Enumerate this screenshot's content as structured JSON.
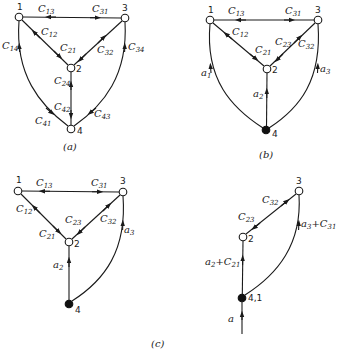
{
  "panels": {
    "a": {
      "caption": "(a)",
      "nodes": [
        {
          "id": "1",
          "label": "1",
          "x": 19,
          "y": 17,
          "filled": false
        },
        {
          "id": "2",
          "label": "2",
          "x": 71,
          "y": 68,
          "filled": false
        },
        {
          "id": "3",
          "label": "3",
          "x": 125,
          "y": 18,
          "filled": false
        },
        {
          "id": "4",
          "label": "4",
          "x": 71,
          "y": 129,
          "filled": false
        }
      ],
      "edge_labels": {
        "c13": {
          "base": "C",
          "sub": "13"
        },
        "c31": {
          "base": "C",
          "sub": "31"
        },
        "c12": {
          "base": "C",
          "sub": "12"
        },
        "c21": {
          "base": "C",
          "sub": "21"
        },
        "c32": {
          "base": "C",
          "sub": "32"
        },
        "c34": {
          "base": "C",
          "sub": "34"
        },
        "c14": {
          "base": "C",
          "sub": "14"
        },
        "c24": {
          "base": "C",
          "sub": "24"
        },
        "c42": {
          "base": "C",
          "sub": "42"
        },
        "c41": {
          "base": "C",
          "sub": "41"
        },
        "c43": {
          "base": "C",
          "sub": "43"
        }
      }
    },
    "b": {
      "caption": "(b)",
      "nodes": [
        {
          "id": "1",
          "label": "1",
          "x": 210,
          "y": 20,
          "filled": false
        },
        {
          "id": "2",
          "label": "2",
          "x": 267,
          "y": 69,
          "filled": false
        },
        {
          "id": "3",
          "label": "3",
          "x": 318,
          "y": 20,
          "filled": false
        },
        {
          "id": "4",
          "label": "4",
          "x": 266,
          "y": 130,
          "filled": true
        }
      ],
      "edge_labels": {
        "c13": {
          "base": "C",
          "sub": "13"
        },
        "c31": {
          "base": "C",
          "sub": "31"
        },
        "c12": {
          "base": "C",
          "sub": "12"
        },
        "c21": {
          "base": "C",
          "sub": "21"
        },
        "c23": {
          "base": "C",
          "sub": "23"
        },
        "c32": {
          "base": "C",
          "sub": "32"
        },
        "a1": {
          "base": "a",
          "sub": "1"
        },
        "a2": {
          "base": "a",
          "sub": "2"
        },
        "a3": {
          "base": "a",
          "sub": "3"
        }
      }
    },
    "c_left": {
      "nodes": [
        {
          "id": "1",
          "label": "1",
          "x": 18,
          "y": 191,
          "filled": false
        },
        {
          "id": "2",
          "label": "2",
          "x": 69,
          "y": 242,
          "filled": false
        },
        {
          "id": "3",
          "label": "3",
          "x": 123,
          "y": 192,
          "filled": false
        },
        {
          "id": "4",
          "label": "4",
          "x": 69,
          "y": 304,
          "filled": true
        }
      ],
      "edge_labels": {
        "c13": {
          "base": "C",
          "sub": "13"
        },
        "c31": {
          "base": "C",
          "sub": "31"
        },
        "c12": {
          "base": "C",
          "sub": "12"
        },
        "c21": {
          "base": "C",
          "sub": "21"
        },
        "c23": {
          "base": "C",
          "sub": "23"
        },
        "c32": {
          "base": "C",
          "sub": "32"
        },
        "a2": {
          "base": "a",
          "sub": "2"
        },
        "a3": {
          "base": "a",
          "sub": "3"
        }
      }
    },
    "c_right": {
      "nodes": [
        {
          "id": "2",
          "label": "2",
          "x": 243,
          "y": 237,
          "filled": false
        },
        {
          "id": "3",
          "label": "3",
          "x": 299,
          "y": 191,
          "filled": false
        },
        {
          "id": "41",
          "label": "4,1",
          "x": 242,
          "y": 298,
          "filled": true
        }
      ],
      "edge_labels": {
        "c23": {
          "base": "C",
          "sub": "23"
        },
        "c32": {
          "base": "C",
          "sub": "32"
        },
        "a2c21": {
          "a": "a",
          "asub": "2",
          "plus": "+",
          "c": "C",
          "csub": "21"
        },
        "a3c31": {
          "a": "a",
          "asub": "3",
          "plus": "+",
          "c": "C",
          "csub": "31"
        },
        "a_in": {
          "base": "a"
        }
      }
    },
    "c": {
      "caption": "(c)"
    }
  }
}
